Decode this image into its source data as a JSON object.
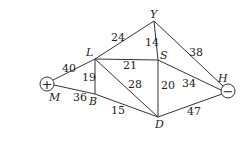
{
  "diagram": {
    "type": "weighted-graph",
    "nodes": [
      {
        "id": "M",
        "label": "M",
        "terminal": "+"
      },
      {
        "id": "L",
        "label": "L"
      },
      {
        "id": "B",
        "label": "B"
      },
      {
        "id": "Y",
        "label": "Y"
      },
      {
        "id": "S",
        "label": "S"
      },
      {
        "id": "D",
        "label": "D"
      },
      {
        "id": "H",
        "label": "H",
        "terminal": "−"
      }
    ],
    "edges": [
      {
        "from": "M",
        "to": "L",
        "weight": "40"
      },
      {
        "from": "M",
        "to": "B",
        "weight": "36"
      },
      {
        "from": "L",
        "to": "B",
        "weight": "19"
      },
      {
        "from": "L",
        "to": "Y",
        "weight": "24"
      },
      {
        "from": "L",
        "to": "S",
        "weight": "21"
      },
      {
        "from": "L",
        "to": "D",
        "weight": "28"
      },
      {
        "from": "B",
        "to": "D",
        "weight": "15"
      },
      {
        "from": "Y",
        "to": "S",
        "weight": "14"
      },
      {
        "from": "Y",
        "to": "H",
        "weight": "38"
      },
      {
        "from": "S",
        "to": "D",
        "weight": "20"
      },
      {
        "from": "S",
        "to": "H",
        "weight": "34"
      },
      {
        "from": "D",
        "to": "H",
        "weight": "47"
      }
    ]
  }
}
